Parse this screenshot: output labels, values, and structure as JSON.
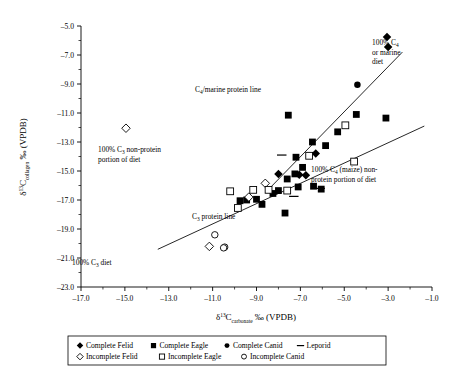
{
  "chart_data": {
    "type": "scatter",
    "title": "",
    "xlabel": "δ¹³C_carbonate ‰ (VPDB)",
    "ylabel": "δ¹³C_collagen ‰ (VPDB)",
    "xlim": [
      -17.0,
      -1.0
    ],
    "ylim": [
      -23.0,
      -5.0
    ],
    "xticks": [
      "-17.0",
      "-15.0",
      "-13.0",
      "-11.0",
      "-9.0",
      "-7.0",
      "-5.0",
      "-3.0",
      "-1.0"
    ],
    "yticks": [
      "-23.0",
      "-21.0",
      "-19.0",
      "-17.0",
      "-15.0",
      "-13.0",
      "-11.0",
      "-9.0",
      "-7.0",
      "-5.0"
    ],
    "grid": false,
    "legend_position": "below-axes",
    "series": [
      {
        "name": "Complete Felid",
        "marker": "filled-diamond",
        "points": [
          [
            -3.05,
            -5.75
          ],
          [
            -3.0,
            -6.45
          ],
          [
            -6.3,
            -13.8
          ],
          [
            -8.0,
            -15.2
          ],
          [
            -7.05,
            -15.25
          ],
          [
            -6.75,
            -15.3
          ]
        ]
      },
      {
        "name": "Complete Eagle",
        "marker": "filled-square",
        "points": [
          [
            -7.55,
            -11.15
          ],
          [
            -4.45,
            -11.1
          ],
          [
            -3.1,
            -11.35
          ],
          [
            -5.3,
            -12.3
          ],
          [
            -6.45,
            -13.0
          ],
          [
            -5.85,
            -13.25
          ],
          [
            -7.2,
            -14.05
          ],
          [
            -6.9,
            -14.75
          ],
          [
            -7.25,
            -15.2
          ],
          [
            -7.6,
            -15.55
          ],
          [
            -7.1,
            -16.1
          ],
          [
            -6.4,
            -16.05
          ],
          [
            -8.25,
            -16.55
          ],
          [
            -9.0,
            -16.95
          ],
          [
            -9.45,
            -17.0
          ],
          [
            -8.75,
            -17.3
          ],
          [
            -7.7,
            -17.9
          ],
          [
            -9.75,
            -17.05
          ],
          [
            -8.0,
            -16.35
          ],
          [
            -6.05,
            -16.25
          ]
        ]
      },
      {
        "name": "Complete Canid",
        "marker": "filled-circle",
        "points": [
          [
            -4.4,
            -9.05
          ]
        ]
      },
      {
        "name": "Leporid",
        "marker": "dash",
        "points": [
          [
            -7.85,
            -13.9
          ],
          [
            -6.1,
            -16.2
          ],
          [
            -7.3,
            -16.75
          ]
        ]
      },
      {
        "name": "Incomplete Felid",
        "marker": "open-diamond",
        "points": [
          [
            -14.95,
            -12.05
          ],
          [
            -8.6,
            -15.85
          ],
          [
            -9.35,
            -16.8
          ],
          [
            -11.15,
            -20.2
          ]
        ]
      },
      {
        "name": "Incomplete Eagle",
        "marker": "open-square",
        "points": [
          [
            -6.6,
            -13.95
          ],
          [
            -4.95,
            -11.85
          ],
          [
            -4.55,
            -14.35
          ],
          [
            -7.6,
            -16.35
          ],
          [
            -8.45,
            -16.3
          ],
          [
            -9.15,
            -16.3
          ],
          [
            -9.85,
            -17.55
          ],
          [
            -10.2,
            -16.4
          ]
        ]
      },
      {
        "name": "Incomplete Canid",
        "marker": "open-circle",
        "points": [
          [
            -10.9,
            -19.4
          ],
          [
            -10.45,
            -20.25
          ],
          [
            -10.5,
            -20.3
          ]
        ]
      }
    ],
    "reference_lines": [
      {
        "name": "C4/marine protein line",
        "from": [
          -8.6,
          -16.5
        ],
        "to": [
          -2.35,
          -6.8
        ]
      },
      {
        "name": "C3 protein line",
        "from": [
          -13.5,
          -20.4
        ],
        "to": [
          -1.35,
          -11.9
        ]
      }
    ],
    "annotations": [
      {
        "name": "c4-marine-protein-line-label",
        "text": "C₄/marine protein line"
      },
      {
        "name": "pct100-c4-marine-diet-label",
        "text": "100% C₄ or marine diet"
      },
      {
        "name": "pct100-c3-nonprotein-label",
        "text": "100% C₃ non-protein portion of diet"
      },
      {
        "name": "pct100-c4-maize-nonprotein-label",
        "text": "100% C₄ (maize) non-protein portion of diet"
      },
      {
        "name": "c3-protein-line-label",
        "text": "C₃ protein line"
      },
      {
        "name": "pct100-c3-diet-label",
        "text": "100% C₃ diet"
      }
    ]
  },
  "axes": {
    "y_title_main": "δ",
    "y_title_sup": "13",
    "y_title_c": "C",
    "y_title_sub": "collagen",
    "y_title_tail": " ‰ (VPDB)",
    "x_title_main": "δ",
    "x_title_sup": "13",
    "x_title_c": "C",
    "x_title_sub": "carbonate",
    "x_title_tail": " ‰ (VPDB)"
  },
  "annotations": {
    "c4_marine_protein_line": "C",
    "c4_marine_protein_line_sub": "4",
    "c4_marine_protein_line_tail": "/marine protein line",
    "c4_diet_l1_a": "100% C",
    "c4_diet_l1_sub": "4",
    "c4_diet_l2": "or marine",
    "c4_diet_l3": "diet",
    "c3_nonprot_l1_a": "100% C",
    "c3_nonprot_l1_sub": "3",
    "c3_nonprot_l1_tail": " non-protein",
    "c3_nonprot_l2": "portion of diet",
    "c4_maize_l1_a": "100% C",
    "c4_maize_l1_sub": "4",
    "c4_maize_l1_tail": " (maize) non-",
    "c4_maize_l2": "protein portion of diet",
    "c3_protein_line_a": "C",
    "c3_protein_line_sub": "3",
    "c3_protein_line_tail": " protein line",
    "c3_diet_a": "100% C",
    "c3_diet_sub": "3",
    "c3_diet_tail": " diet"
  },
  "ticks": {
    "x": [
      "-17.0",
      "-15.0",
      "-13.0",
      "-11.0",
      "-9.0",
      "-7.0",
      "-5.0",
      "-3.0",
      "-1.0"
    ],
    "y": [
      "-5.0",
      "-7.0",
      "-9.0",
      "-11.0",
      "-13.0",
      "-15.0",
      "-17.0",
      "-19.0",
      "-21.0",
      "-23.0"
    ]
  },
  "legend": {
    "row1": [
      {
        "marker": "filled-diamond",
        "label": "Complete Felid"
      },
      {
        "marker": "filled-square",
        "label": "Complete Eagle"
      },
      {
        "marker": "filled-circle",
        "label": "Complete Canid"
      },
      {
        "marker": "dash",
        "label": "Leporid"
      }
    ],
    "row2": [
      {
        "marker": "open-diamond",
        "label": "Incomplete Felid"
      },
      {
        "marker": "open-square",
        "label": "Incomplete Eagle"
      },
      {
        "marker": "open-circle",
        "label": "Incomplete Canid"
      }
    ]
  }
}
